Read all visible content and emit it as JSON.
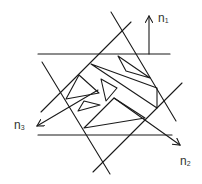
{
  "diagram": {
    "title": "",
    "stroke_color": "#1a1a1a",
    "background": "#ffffff",
    "labels": [
      {
        "id": "n1",
        "base": "n",
        "sub": "1",
        "x": 158,
        "y": 12
      },
      {
        "id": "n2",
        "base": "n",
        "sub": "2",
        "x": 180,
        "y": 155
      },
      {
        "id": "n3",
        "base": "n",
        "sub": "3",
        "x": 14,
        "y": 119
      }
    ],
    "boundary_lines": [
      {
        "id": "top-horizontal",
        "x1": 38,
        "y1": 54,
        "x2": 170,
        "y2": 54
      },
      {
        "id": "bottom-horizontal",
        "x1": 38,
        "y1": 135,
        "x2": 172,
        "y2": 135
      },
      {
        "id": "left-diagonal-down",
        "x1": 42,
        "y1": 62,
        "x2": 110,
        "y2": 174
      },
      {
        "id": "right-diagonal-down",
        "x1": 111,
        "y1": 12,
        "x2": 176,
        "y2": 121
      },
      {
        "id": "upper-diagonal-up",
        "x1": 41,
        "y1": 112,
        "x2": 131,
        "y2": 22
      },
      {
        "id": "lower-diagonal-up",
        "x1": 93,
        "y1": 172,
        "x2": 182,
        "y2": 83
      }
    ],
    "normal_vectors": [
      {
        "id": "n1-arrow",
        "x1": 149,
        "y1": 54,
        "x2": 149,
        "y2": 16
      },
      {
        "id": "n2-arrow",
        "x1": 114,
        "y1": 98,
        "x2": 180,
        "y2": 145
      },
      {
        "id": "n3-arrow",
        "x1": 98,
        "y1": 90,
        "x2": 37,
        "y2": 126
      }
    ],
    "fragments": [
      {
        "id": "top-right-sliver",
        "points": "118,56 126,71 150,78"
      },
      {
        "id": "upper-band",
        "points": "91,64 157,88 157,108 91,64"
      },
      {
        "id": "left-triangle",
        "points": "79,75 66,99 99,93"
      },
      {
        "id": "middle-triangle",
        "points": "101,79 106,101 117,88"
      },
      {
        "id": "small-triangle",
        "points": "78,111 84,101 100,105"
      },
      {
        "id": "lower-triangle",
        "points": "114,98 84,128 145,118"
      }
    ]
  }
}
